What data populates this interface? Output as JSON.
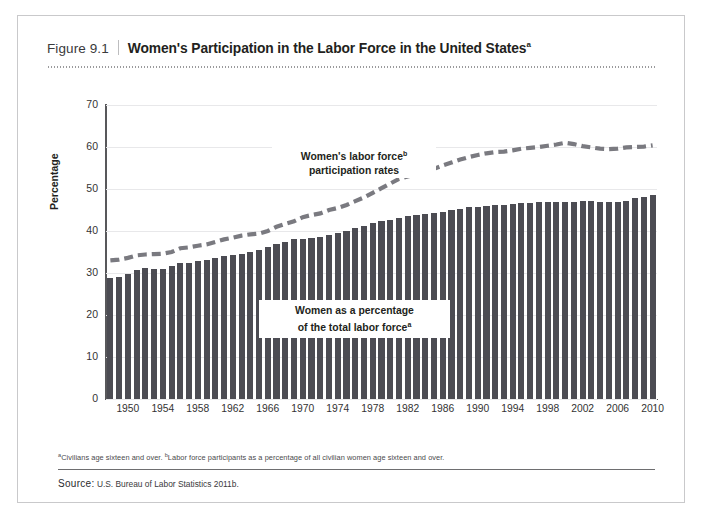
{
  "figure": {
    "number": "Figure 9.1",
    "title": "Women's Participation in the Labor Force in the United States",
    "title_superscript": "a"
  },
  "footnote": {
    "marker_a": "a",
    "text_a": "Civilians age sixteen and over. ",
    "marker_b": "b",
    "text_b": "Labor force participants as a percentage of all civilian women age sixteen and over."
  },
  "source": {
    "label": "Source:",
    "text": "U.S. Bureau of Labor Statistics 2011b."
  },
  "annotations": {
    "line_label_1": "Women's labor force",
    "line_label_sup": "b",
    "line_label_2": "participation rates",
    "bar_label_1": "Women as a percentage",
    "bar_label_2": "of the total labor force",
    "bar_label_sup": "a"
  },
  "colors": {
    "bar": "#4c4c53",
    "dash_line": "#7a7a80",
    "axis": "#58585b",
    "grid": "#e8e8ea",
    "frame": "#c9c9cb"
  },
  "chart_data": {
    "type": "bar",
    "title": "Women's Participation in the Labor Force in the United States",
    "xlabel": "",
    "ylabel": "Percentage",
    "ylim": [
      0,
      70
    ],
    "yticks": [
      0,
      10,
      20,
      30,
      40,
      50,
      60,
      70
    ],
    "grid": true,
    "legend_position": "inline-annotation",
    "xtick_labels": [
      "1950",
      "1954",
      "1958",
      "1962",
      "1966",
      "1970",
      "1974",
      "1978",
      "1982",
      "1986",
      "1990",
      "1994",
      "1998",
      "2002",
      "2006",
      "2010"
    ],
    "xtick_years": [
      1950,
      1954,
      1958,
      1962,
      1966,
      1970,
      1974,
      1978,
      1982,
      1986,
      1990,
      1994,
      1998,
      2002,
      2006,
      2010
    ],
    "x": [
      1948,
      1949,
      1950,
      1951,
      1952,
      1953,
      1954,
      1955,
      1956,
      1957,
      1958,
      1959,
      1960,
      1961,
      1962,
      1963,
      1964,
      1965,
      1966,
      1967,
      1968,
      1969,
      1970,
      1971,
      1972,
      1973,
      1974,
      1975,
      1976,
      1977,
      1978,
      1979,
      1980,
      1981,
      1982,
      1983,
      1984,
      1985,
      1986,
      1987,
      1988,
      1989,
      1990,
      1991,
      1992,
      1993,
      1994,
      1995,
      1996,
      1997,
      1998,
      1999,
      2000,
      2001,
      2002,
      2003,
      2004,
      2005,
      2006,
      2007,
      2008,
      2009,
      2010
    ],
    "series": [
      {
        "name": "Women as a percentage of the total labor force",
        "type": "bar",
        "values": [
          28.8,
          29.0,
          29.8,
          30.6,
          31.1,
          31.0,
          31.0,
          31.7,
          32.3,
          32.5,
          32.9,
          33.1,
          33.6,
          34.0,
          34.2,
          34.5,
          35.0,
          35.5,
          36.2,
          37.0,
          37.5,
          38.0,
          38.2,
          38.4,
          38.6,
          39.1,
          39.6,
          40.1,
          40.6,
          41.2,
          41.8,
          42.3,
          42.6,
          43.0,
          43.5,
          43.7,
          44.0,
          44.3,
          44.6,
          45.1,
          45.3,
          45.6,
          45.8,
          45.9,
          46.1,
          46.3,
          46.5,
          46.6,
          46.7,
          46.8,
          46.9,
          46.9,
          47.0,
          47.0,
          47.2,
          47.2,
          46.8,
          46.8,
          47.0,
          47.2,
          47.8,
          48.2,
          48.5
        ]
      },
      {
        "name": "Women's labor force participation rates",
        "type": "line",
        "style": "dashed",
        "values": [
          33.0,
          33.2,
          33.6,
          34.2,
          34.4,
          34.5,
          34.6,
          35.0,
          35.9,
          36.1,
          36.5,
          36.8,
          37.4,
          38.0,
          38.4,
          38.9,
          39.2,
          39.4,
          40.0,
          41.0,
          41.7,
          42.3,
          43.3,
          43.8,
          44.2,
          45.0,
          45.5,
          46.2,
          47.1,
          48.0,
          49.1,
          50.2,
          51.3,
          52.4,
          53.0,
          53.5,
          54.0,
          54.8,
          55.6,
          56.3,
          57.0,
          57.6,
          58.1,
          58.5,
          58.8,
          58.9,
          59.2,
          59.6,
          59.8,
          60.0,
          60.3,
          60.6,
          61.0,
          60.7,
          60.2,
          59.9,
          59.6,
          59.5,
          59.6,
          59.9,
          60.0,
          60.1,
          60.4
        ]
      }
    ]
  }
}
